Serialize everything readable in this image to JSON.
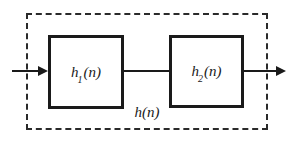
{
  "diagram": {
    "type": "block-diagram-cascade",
    "blocks": [
      {
        "base": "h",
        "sub": "1",
        "args": "(n)"
      },
      {
        "base": "h",
        "sub": "2",
        "args": "(n)"
      }
    ],
    "overall_system": {
      "base": "h",
      "args": "(n)"
    },
    "colors": {
      "line": "#1a1a1a",
      "dashed_border": "#2a2a2a",
      "background": "#ffffff"
    }
  }
}
